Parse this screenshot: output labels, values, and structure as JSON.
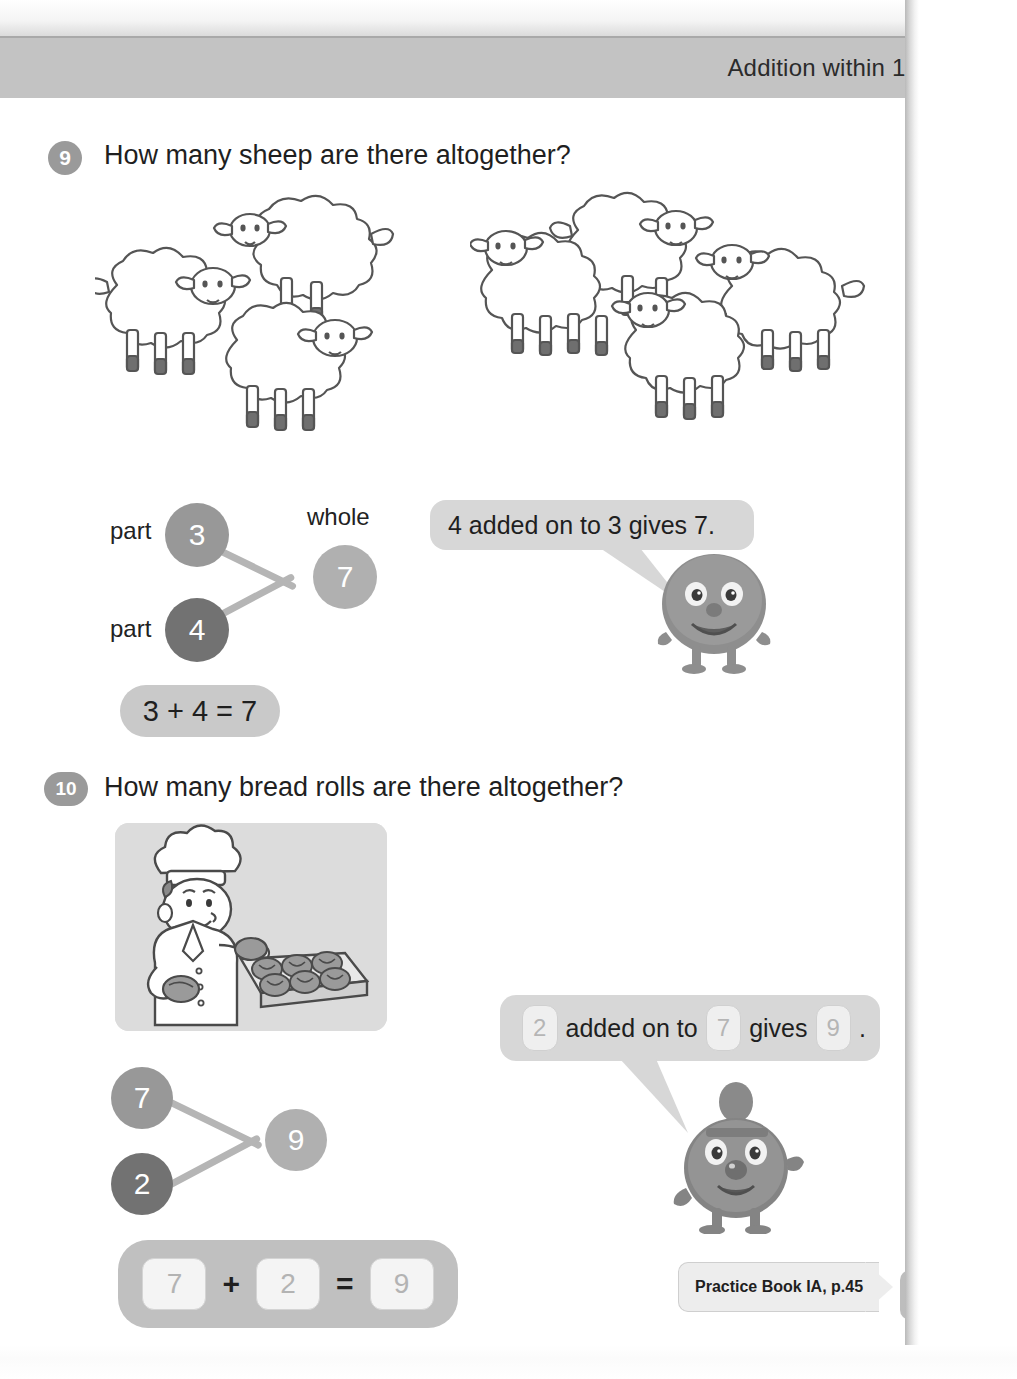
{
  "header": {
    "chapter_title": "Addition within 10",
    "unit_label": "Unit 3"
  },
  "questions": [
    {
      "number": "9",
      "prompt": "How many sheep are there altogether?",
      "sheep_group_left_count": 3,
      "sheep_group_right_count": 4,
      "bond": {
        "part_label_top": "part",
        "part_label_bottom": "part",
        "whole_label": "whole",
        "part_a": "3",
        "part_b": "4",
        "whole": "7"
      },
      "equation": "3 + 4 = 7",
      "bubble_text": "4 added on to 3 gives 7."
    },
    {
      "number": "10",
      "prompt": "How many bread rolls are there altogether?",
      "bond": {
        "part_a": "7",
        "part_b": "2",
        "whole": "9"
      },
      "equation_boxes": {
        "first": "7",
        "plus": "+",
        "second": "2",
        "equals": "=",
        "result": "9"
      },
      "bubble": {
        "box_a": "2",
        "text_mid_1": "added on to",
        "box_b": "7",
        "text_mid_2": "gives",
        "box_c": "9",
        "period": "."
      }
    }
  ],
  "footer": {
    "practice_reference": "Practice Book IA, p.45",
    "page_number": "33"
  },
  "colors": {
    "header_band": "#c3c3c3",
    "node_part_a": "#989898",
    "node_part_b": "#727272",
    "node_whole": "#b0b0b0",
    "bubble_bg": "#d7d7d7",
    "pill_bg": "#c9c9c9"
  }
}
